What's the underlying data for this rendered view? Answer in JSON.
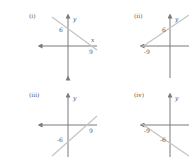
{
  "diagram": {
    "colors": {
      "axis": "#7a7a7a",
      "line": "#c4c4c4",
      "text": "#555555"
    },
    "panels": [
      {
        "label": "(i)",
        "y_label": "y",
        "x_label": "x",
        "y_intercept": "6",
        "x_intercept": "9"
      },
      {
        "label": "(ii)",
        "y_label": "y",
        "x_label": "x",
        "y_intercept": "6",
        "x_intercept": "-9"
      },
      {
        "label": "(iii)",
        "y_label": "y",
        "x_label": "x",
        "y_intercept": "-6",
        "x_intercept": "9"
      },
      {
        "label": "(iv)",
        "y_label": "y",
        "x_label": "x",
        "y_intercept": "-6",
        "x_intercept": "-9"
      }
    ]
  }
}
